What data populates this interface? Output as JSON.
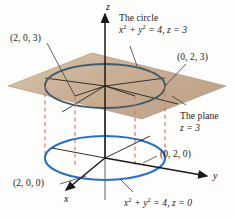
{
  "figure": {
    "title_alt": "Cylinder x^2 + y^2 = 4 intersected by the plane z = 3",
    "background": "#fdfdfc"
  },
  "colors": {
    "plane_fill": "#c5a98d",
    "plane_fill_light": "#d8c4ab",
    "upper_circle": "#3f5a6b",
    "lower_circle": "#2b6fc4",
    "dashed_connector": "#d4706a",
    "axis": "#1a1a1a",
    "leader_line": "#3a3a3a",
    "text": "#1a1a1a"
  },
  "axes": {
    "x": {
      "label": "x",
      "label_x": 68,
      "label_y": 196
    },
    "y": {
      "label": "y",
      "label_x": 215,
      "label_y": 172
    },
    "z": {
      "label": "z",
      "label_x": 106,
      "label_y": 3
    }
  },
  "labels": {
    "circle_title": "The circle",
    "circle_equation_pre": "x",
    "circle_equation_sup1": "2",
    "circle_equation_mid": " + y",
    "circle_equation_sup2": "2",
    "circle_equation_post": " = 4, z = 3",
    "plane_title": "The plane",
    "plane_equation": "z = 3",
    "point_203": "(2, 0, 3)",
    "point_023": "(0, 2, 3)",
    "point_200": "(2, 0, 0)",
    "point_020": "(0, 2, 0)",
    "bottom_equation_pre": "x",
    "bottom_equation_sup1": "2",
    "bottom_equation_mid": " + y",
    "bottom_equation_sup2": "2",
    "bottom_equation_post": " = 4, z = 0"
  },
  "geometry": {
    "plane": {
      "points": "8,86 92,53 226,86 142,119",
      "z_value": 3
    },
    "upper_ellipse": {
      "cx": 105,
      "cy": 86,
      "rx": 60,
      "ry": 22
    },
    "lower_ellipse": {
      "cx": 105,
      "cy": 158,
      "rx": 60,
      "ry": 22
    },
    "connectors": [
      {
        "x": 45,
        "y1": 86,
        "y2": 158
      },
      {
        "x": 75,
        "y1": 96,
        "y2": 168
      },
      {
        "x": 135,
        "y1": 96,
        "y2": 168
      },
      {
        "x": 165,
        "y1": 86,
        "y2": 158
      }
    ],
    "radius": 2
  }
}
